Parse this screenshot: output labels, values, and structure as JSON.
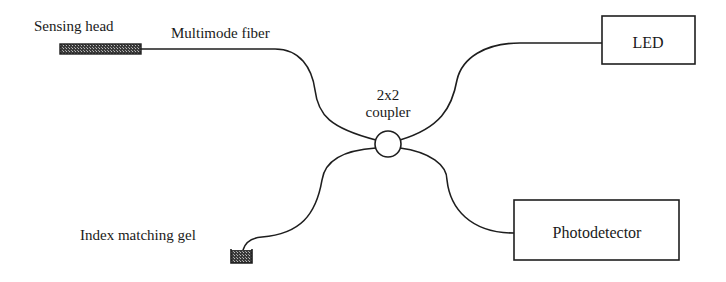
{
  "diagram": {
    "type": "fiber-optic sensor schematic",
    "labels": {
      "sensing_head": "Sensing head",
      "multimode_fiber": "Multimode fiber",
      "coupler_line1": "2x2",
      "coupler_line2": "coupler",
      "led": "LED",
      "photodetector": "Photodetector",
      "index_matching_gel": "Index matching gel"
    },
    "components": [
      {
        "id": "sensing-head",
        "label": "Sensing head"
      },
      {
        "id": "coupler",
        "label": "2x2 coupler"
      },
      {
        "id": "led",
        "label": "LED"
      },
      {
        "id": "photodetector",
        "label": "Photodetector"
      },
      {
        "id": "index-matching-gel",
        "label": "Index matching gel"
      }
    ],
    "connections": [
      {
        "from": "sensing-head",
        "to": "coupler",
        "via": "Multimode fiber"
      },
      {
        "from": "led",
        "to": "coupler"
      },
      {
        "from": "coupler",
        "to": "photodetector"
      },
      {
        "from": "coupler",
        "to": "index-matching-gel"
      }
    ],
    "colors": {
      "line": "#1e1e1e",
      "background": "#ffffff"
    }
  }
}
